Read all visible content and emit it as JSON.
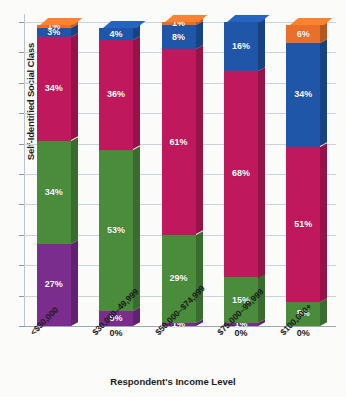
{
  "chart_data": {
    "type": "bar",
    "subtype": "stacked-100-percent-3d",
    "title": "",
    "xlabel": "Respondent's Income Level",
    "ylabel": "Self-Identified Social Class",
    "categories": [
      "<$30,000",
      "$30,000–49,999",
      "$50,000–$74,999",
      "$75,000–99,999",
      "$100,000+"
    ],
    "series": [
      {
        "name": "class-1",
        "color": "#7B2D8E",
        "values": [
          27,
          5,
          1,
          1,
          0
        ],
        "labels": [
          "27%",
          "5%",
          "1%",
          "1%",
          "0%"
        ]
      },
      {
        "name": "class-2",
        "color": "#4A8B3C",
        "values": [
          34,
          53,
          29,
          15,
          8
        ],
        "labels": [
          "34%",
          "53%",
          "29%",
          "15%",
          "8%"
        ]
      },
      {
        "name": "class-3",
        "color": "#C0185C",
        "values": [
          34,
          36,
          61,
          68,
          51
        ],
        "labels": [
          "34%",
          "36%",
          "61%",
          "68%",
          "51%"
        ]
      },
      {
        "name": "class-4",
        "color": "#1F56A8",
        "values": [
          3,
          4,
          8,
          16,
          34
        ],
        "labels": [
          "3%",
          "4%",
          "8%",
          "16%",
          "34%"
        ]
      },
      {
        "name": "class-5",
        "color": "#E8702A",
        "values": [
          1,
          0,
          1,
          0,
          6
        ],
        "labels": [
          "1%",
          "0%",
          "1%",
          "0%",
          "6%"
        ]
      }
    ],
    "ylim": [
      0,
      100
    ],
    "y_tick_interval": 10,
    "y_tick_labels_visible": false,
    "grid": true,
    "legend": "none",
    "gridline_color": "#c9d2dd"
  },
  "axes": {
    "y_title": "Self-Identified Social Class",
    "x_title": "Respondent's Income Level"
  }
}
